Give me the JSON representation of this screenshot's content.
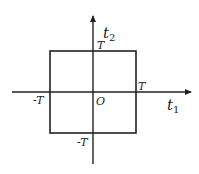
{
  "diagram": {
    "axes": {
      "x_label": "t",
      "x_subscript": "1",
      "y_label": "t",
      "y_subscript": "2",
      "origin_label": "O"
    },
    "region": {
      "shape": "square",
      "top_label": "T",
      "right_label": "T",
      "left_label": "-T",
      "bottom_label": "-T"
    },
    "colors": {
      "line": "#222222",
      "background": "#ffffff"
    }
  }
}
